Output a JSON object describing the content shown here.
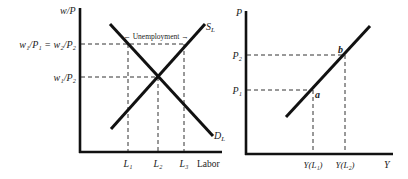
{
  "left_panel": {
    "y_axis_label": "w/P",
    "x_axis_label": "Labor",
    "y_ticks": [
      {
        "label": "w₁/P₁ = w₂/P₂",
        "y": 44
      },
      {
        "label": "w₁/P₂",
        "y": 77
      }
    ],
    "x_ticks": [
      {
        "label": "L₁",
        "x": 128
      },
      {
        "label": "L₂",
        "x": 158
      },
      {
        "label": "L₃",
        "x": 184
      }
    ],
    "curves": {
      "supply_label": "S",
      "supply_sub": "L",
      "demand_label": "D",
      "demand_sub": "L"
    },
    "annotation": "← Unemployment →"
  },
  "right_panel": {
    "y_axis_label": "P",
    "x_axis_label": "Y",
    "y_ticks": [
      {
        "label": "P₂",
        "y": 55
      },
      {
        "label": "P₁",
        "y": 90
      }
    ],
    "x_ticks": [
      {
        "label": "Y(L₁)",
        "x": 313
      },
      {
        "label": "Y(L₂)",
        "x": 345
      }
    ],
    "points": [
      {
        "label": "a",
        "x": 313,
        "y": 90
      },
      {
        "label": "b",
        "x": 345,
        "y": 55
      }
    ]
  }
}
